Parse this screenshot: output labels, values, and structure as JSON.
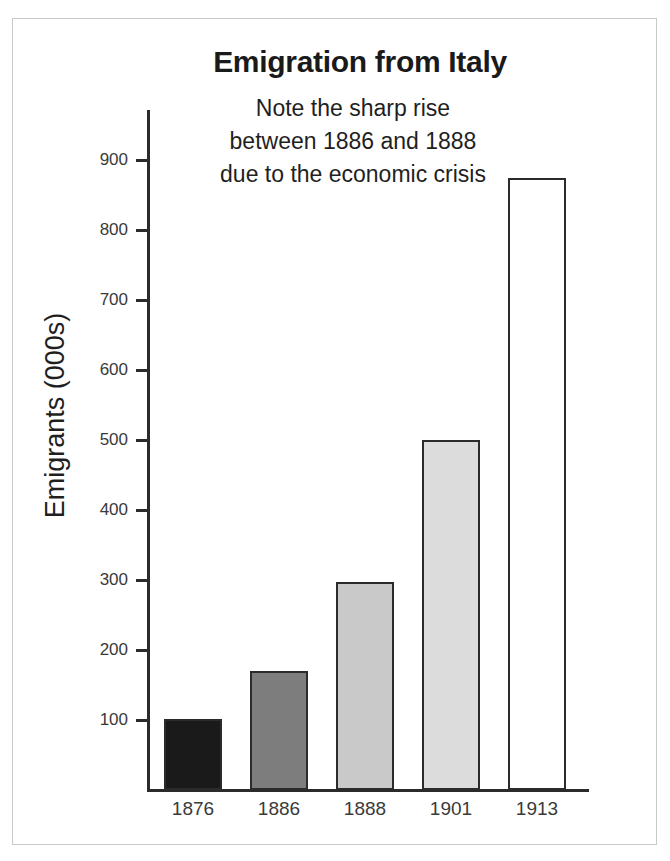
{
  "chart_data": {
    "type": "bar",
    "title": "Emigration from Italy",
    "xlabel": "",
    "ylabel": "Emigrants (000s)",
    "categories": [
      "1876",
      "1886",
      "1888",
      "1901",
      "1913"
    ],
    "values": [
      102,
      170,
      297,
      500,
      875
    ],
    "bar_colors": [
      "#1a1a1a",
      "#7d7d7d",
      "#c9c9c9",
      "#dcdcdc",
      "#ffffff"
    ],
    "bar_border_color": "#2b2b2b",
    "ylim": [
      0,
      930
    ],
    "yticks": [
      100,
      200,
      300,
      400,
      500,
      600,
      700,
      800,
      900
    ],
    "ytick_labels": [
      "100",
      "200",
      "300",
      "400",
      "500",
      "600",
      "700",
      "800",
      "900"
    ],
    "grid": false,
    "legend": false,
    "annotations": [
      {
        "lines": [
          "Note the sharp rise",
          "between 1886 and 1888",
          "due to the economic crisis"
        ]
      }
    ]
  },
  "figure": {
    "background_color": "#ffffff",
    "frame_color": "#c8c8c8",
    "axis_color": "#2b2b2b"
  }
}
